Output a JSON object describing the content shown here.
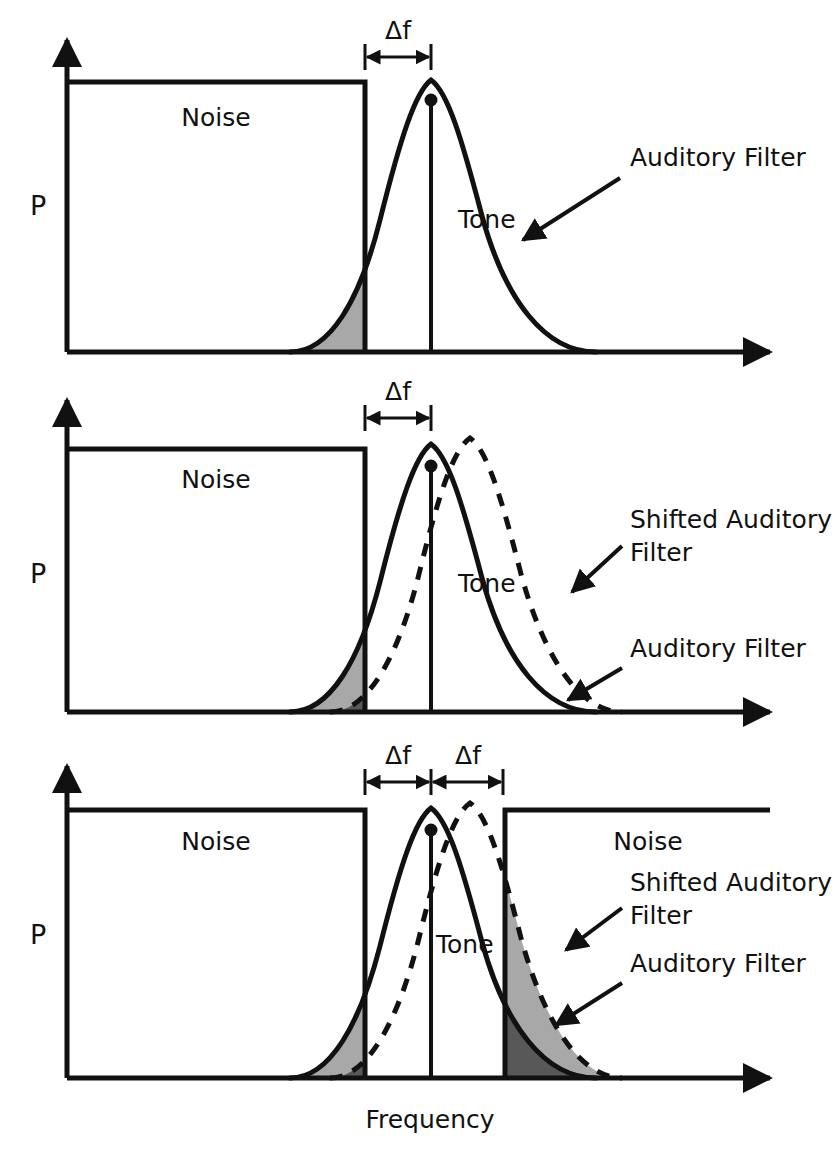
{
  "figure": {
    "axis_y_label": "P",
    "axis_x_label": "Frequency"
  },
  "colors": {
    "ink": "#111111",
    "light_shade": "#a8a8a8",
    "dark_shade": "#585858",
    "background": "#ffffff"
  },
  "labels": {
    "noise": "Noise",
    "tone": "Tone",
    "auditory_filter": "Auditory Filter",
    "shifted_auditory_filter_line1": "Shifted Auditory",
    "shifted_auditory_filter_line2": "Filter",
    "delta_f": "Δf"
  },
  "panels": [
    {
      "id": "panel-1",
      "axis_y_label": "P",
      "noise_bands": [
        {
          "name": "left-noise-band",
          "label": "Noise",
          "x_start": 67,
          "x_end": 365,
          "top": 82,
          "baseline": 352
        }
      ],
      "filters": [
        {
          "name": "auditory-filter",
          "style": "solid",
          "peak_x": 431,
          "peak_y": 80,
          "left_base_x": 290,
          "right_base_x": 596
        }
      ],
      "tone": {
        "label": "Tone",
        "x": 431,
        "top_y": 100,
        "baseline": 352
      },
      "shaded_regions": [
        {
          "name": "noise-filter-overlap",
          "shade": "light",
          "x_start": 290,
          "x_end": 365
        }
      ],
      "delta_f_markers": [
        {
          "label": "Δf",
          "x_start": 365,
          "x_end": 431,
          "y": 56
        }
      ],
      "callouts": [
        {
          "label": "Auditory Filter",
          "text_x": 630,
          "text_y": 165,
          "arrow_from_x": 620,
          "arrow_from_y": 178,
          "arrow_to_x": 523,
          "arrow_to_y": 240
        }
      ]
    },
    {
      "id": "panel-2",
      "axis_y_label": "P",
      "noise_bands": [
        {
          "name": "left-noise-band",
          "label": "Noise",
          "x_start": 67,
          "x_end": 365,
          "top": 449,
          "baseline": 712
        }
      ],
      "filters": [
        {
          "name": "auditory-filter",
          "style": "solid",
          "peak_x": 431,
          "peak_y": 444,
          "left_base_x": 290,
          "right_base_x": 596
        },
        {
          "name": "shifted-auditory-filter",
          "style": "dashed",
          "peak_x": 470,
          "peak_y": 438,
          "left_base_x": 330,
          "right_base_x": 622
        }
      ],
      "tone": {
        "label": "Tone",
        "x": 431,
        "top_y": 466,
        "baseline": 712
      },
      "shaded_regions": [
        {
          "name": "noise-auditory-filter-overlap",
          "shade": "light",
          "x_start": 290,
          "x_end": 365
        },
        {
          "name": "noise-shifted-filter-overlap",
          "shade": "dark",
          "x_start": 330,
          "x_end": 365
        }
      ],
      "delta_f_markers": [
        {
          "label": "Δf",
          "x_start": 365,
          "x_end": 431,
          "y": 417
        }
      ],
      "callouts": [
        {
          "label": "Shifted Auditory Filter",
          "text_x": 631,
          "text_y": 530,
          "arrow_from_x": 622,
          "arrow_from_y": 546,
          "arrow_to_x": 572,
          "arrow_to_y": 592
        },
        {
          "label": "Auditory Filter",
          "text_x": 631,
          "text_y": 655,
          "arrow_from_x": 622,
          "arrow_from_y": 668,
          "arrow_to_x": 568,
          "arrow_to_y": 700
        }
      ]
    },
    {
      "id": "panel-3",
      "axis_y_label": "P",
      "axis_x_label": "Frequency",
      "noise_bands": [
        {
          "name": "left-noise-band",
          "label": "Noise",
          "x_start": 67,
          "x_end": 365,
          "top": 810,
          "baseline": 1078
        },
        {
          "name": "right-noise-band",
          "label": "Noise",
          "x_start": 505,
          "x_end": 770,
          "top": 810,
          "baseline": 1078
        }
      ],
      "filters": [
        {
          "name": "auditory-filter",
          "style": "solid",
          "peak_x": 431,
          "peak_y": 808,
          "left_base_x": 290,
          "right_base_x": 596
        },
        {
          "name": "shifted-auditory-filter",
          "style": "dashed",
          "peak_x": 470,
          "peak_y": 803,
          "left_base_x": 330,
          "right_base_x": 622
        }
      ],
      "tone": {
        "label": "Tone",
        "x": 431,
        "top_y": 830,
        "baseline": 1078
      },
      "shaded_regions": [
        {
          "name": "left-noise-auditory-filter-overlap",
          "shade": "light",
          "x_start": 290,
          "x_end": 365
        },
        {
          "name": "left-noise-shifted-filter-overlap",
          "shade": "dark",
          "x_start": 330,
          "x_end": 365
        },
        {
          "name": "right-noise-shifted-filter-overlap",
          "shade": "light",
          "x_start": 505,
          "x_end": 622
        },
        {
          "name": "right-noise-auditory-filter-overlap",
          "shade": "dark",
          "x_start": 505,
          "x_end": 596
        }
      ],
      "delta_f_markers": [
        {
          "label": "Δf",
          "x_start": 365,
          "x_end": 431,
          "y": 781
        },
        {
          "label": "Δf",
          "x_start": 431,
          "x_end": 503,
          "y": 781
        }
      ],
      "callouts": [
        {
          "label": "Shifted Auditory Filter",
          "text_x": 631,
          "text_y": 893,
          "arrow_from_x": 622,
          "arrow_from_y": 908,
          "arrow_to_x": 566,
          "arrow_to_y": 950
        },
        {
          "label": "Auditory Filter",
          "text_x": 631,
          "text_y": 970,
          "arrow_from_x": 622,
          "arrow_from_y": 983,
          "arrow_to_x": 556,
          "arrow_to_y": 1025
        }
      ]
    }
  ]
}
